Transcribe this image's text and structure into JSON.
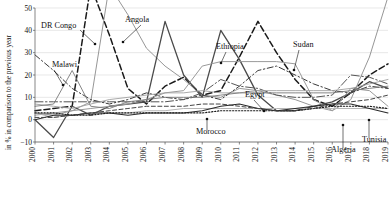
{
  "chart_data": {
    "type": "line",
    "title": "",
    "xlabel": "",
    "ylabel": "in % in comparison to the previous year",
    "x": [
      2000,
      2001,
      2002,
      2003,
      2004,
      2005,
      2006,
      2007,
      2008,
      2009,
      2010,
      2011,
      2012,
      2013,
      2014,
      2015,
      2016,
      2017,
      2018,
      2019
    ],
    "xlim": [
      2000,
      2019
    ],
    "ylim": [
      -10,
      50
    ],
    "yticks": [
      -10,
      0,
      10,
      20,
      30,
      40,
      50
    ],
    "xticks": [
      "2000",
      "2001",
      "2002",
      "2003",
      "2004",
      "2005",
      "2006",
      "2007",
      "2008",
      "2009",
      "2010",
      "2011",
      "2012",
      "2013",
      "2014",
      "2015",
      "2016",
      "2017",
      "2018",
      "2019"
    ],
    "grid": true,
    "legend": "inline-annotations",
    "series": [
      {
        "name": "DR Congo",
        "style": "dashed",
        "color": "#1a1a1a",
        "width": 1.5,
        "values": [
          4,
          5,
          6,
          60,
          38,
          14,
          7,
          15,
          19,
          11,
          13,
          28,
          44,
          30,
          18,
          9,
          6,
          12,
          20,
          25
        ]
      },
      {
        "name": "Angola",
        "style": "solid-thin",
        "color": "#8a8a8a",
        "width": 0.9,
        "values": [
          3,
          2,
          4,
          8,
          60,
          47,
          32,
          24,
          18,
          11,
          10,
          14,
          13,
          11,
          9,
          6,
          4,
          9,
          28,
          55
        ]
      },
      {
        "name": "Malawi",
        "style": "dash-dot",
        "color": "#3a3a3a",
        "width": 1.0,
        "values": [
          29,
          22,
          14,
          9,
          7,
          9,
          12,
          10,
          9,
          11,
          9,
          15,
          22,
          24,
          20,
          16,
          13,
          12,
          15,
          14
        ]
      },
      {
        "name": "Ethiopia",
        "style": "solid",
        "color": "#4a4a4a",
        "width": 1.3,
        "values": [
          0,
          -8,
          6,
          2,
          6,
          7,
          8,
          44,
          20,
          10,
          40,
          27,
          11,
          4,
          4,
          6,
          8,
          12,
          17,
          14
        ]
      },
      {
        "name": "Sudan",
        "style": "solid-thin",
        "color": "#9a9a9a",
        "width": 1.0,
        "values": [
          2,
          3,
          4,
          5,
          6,
          7,
          9,
          12,
          13,
          24,
          26,
          26,
          26,
          26,
          25,
          9,
          4,
          14,
          13,
          6
        ]
      },
      {
        "name": "Egypt",
        "style": "dash-dot-long",
        "color": "#555555",
        "width": 1.0,
        "values": [
          8,
          8,
          8,
          8,
          8,
          8,
          8,
          8,
          9,
          12,
          18,
          15,
          14,
          11,
          10,
          10,
          11,
          20,
          19,
          16
        ]
      },
      {
        "name": "Morocco",
        "style": "solid-light",
        "color": "#b5b5b5",
        "width": 1.0,
        "values": [
          3,
          1,
          2,
          3,
          3,
          3,
          4,
          4,
          5,
          5,
          5,
          5,
          5,
          5,
          5,
          5,
          5,
          5,
          5,
          5
        ]
      },
      {
        "name": "Algeria",
        "style": "solid-dark",
        "color": "#2a2a2a",
        "width": 1.1,
        "values": [
          0,
          2,
          2,
          3,
          3,
          2,
          3,
          3,
          3,
          4,
          6,
          7,
          5,
          4,
          5,
          6,
          7,
          7,
          5,
          3
        ]
      },
      {
        "name": "Tunisia",
        "style": "dotted",
        "color": "#1a1a1a",
        "width": 1.2,
        "values": [
          3,
          3,
          2,
          2,
          3,
          3,
          3,
          3,
          3,
          3,
          4,
          4,
          4,
          4,
          4,
          5,
          6,
          6,
          6,
          5
        ]
      },
      {
        "name": "series-grey-1",
        "style": "solid-thin",
        "color": "#a0a0a0",
        "width": 0.9,
        "values": [
          7,
          6,
          5,
          7,
          9,
          10,
          11,
          12,
          12,
          13,
          12,
          12,
          13,
          13,
          13,
          13,
          13,
          14,
          16,
          18
        ]
      },
      {
        "name": "series-grey-2",
        "style": "solid-thin",
        "color": "#787878",
        "width": 0.9,
        "values": [
          6,
          7,
          22,
          6,
          5,
          8,
          9,
          10,
          10,
          10,
          11,
          12,
          12,
          12,
          12,
          12,
          12,
          13,
          14,
          15
        ]
      },
      {
        "name": "series-dash-2",
        "style": "dashed-thin",
        "color": "#444444",
        "width": 1.0,
        "values": [
          1,
          1,
          2,
          3,
          4,
          5,
          6,
          6,
          6,
          7,
          7,
          6,
          5,
          4,
          4,
          5,
          7,
          8,
          9,
          11
        ]
      }
    ],
    "annotations": [
      {
        "label": "DR Congo",
        "x": 41,
        "y": 28,
        "leader": [
          [
            80,
            30
          ],
          [
            95,
            44
          ]
        ]
      },
      {
        "label": "Angola",
        "x": 125,
        "y": 22,
        "leader": [
          [
            141,
            25
          ],
          [
            123,
            42
          ]
        ]
      },
      {
        "label": "Malawi",
        "x": 52,
        "y": 67,
        "leader": [
          [
            54,
            70
          ],
          [
            63,
            85
          ]
        ]
      },
      {
        "label": "Ethiopia",
        "x": 216,
        "y": 49,
        "leader": [
          [
            226,
            52
          ],
          [
            221,
            63
          ]
        ]
      },
      {
        "label": "Sudan",
        "x": 293,
        "y": 47,
        "leader": [
          [
            299,
            50
          ],
          [
            294,
            70
          ]
        ]
      },
      {
        "label": "Egypt",
        "x": 245,
        "y": 97,
        "leader": [
          [
            254,
            100
          ],
          [
            264,
            111
          ]
        ]
      },
      {
        "label": "Morocco",
        "x": 196,
        "y": 134,
        "leader": [
          [
            207,
            130
          ],
          [
            207,
            119
          ]
        ]
      },
      {
        "label": "Algeria",
        "x": 331,
        "y": 152,
        "leader": [
          [
            343,
            148
          ],
          [
            343,
            125
          ]
        ]
      },
      {
        "label": "Tunisia",
        "x": 362,
        "y": 142,
        "leader": [
          [
            369,
            138
          ],
          [
            369,
            120
          ]
        ]
      }
    ]
  }
}
